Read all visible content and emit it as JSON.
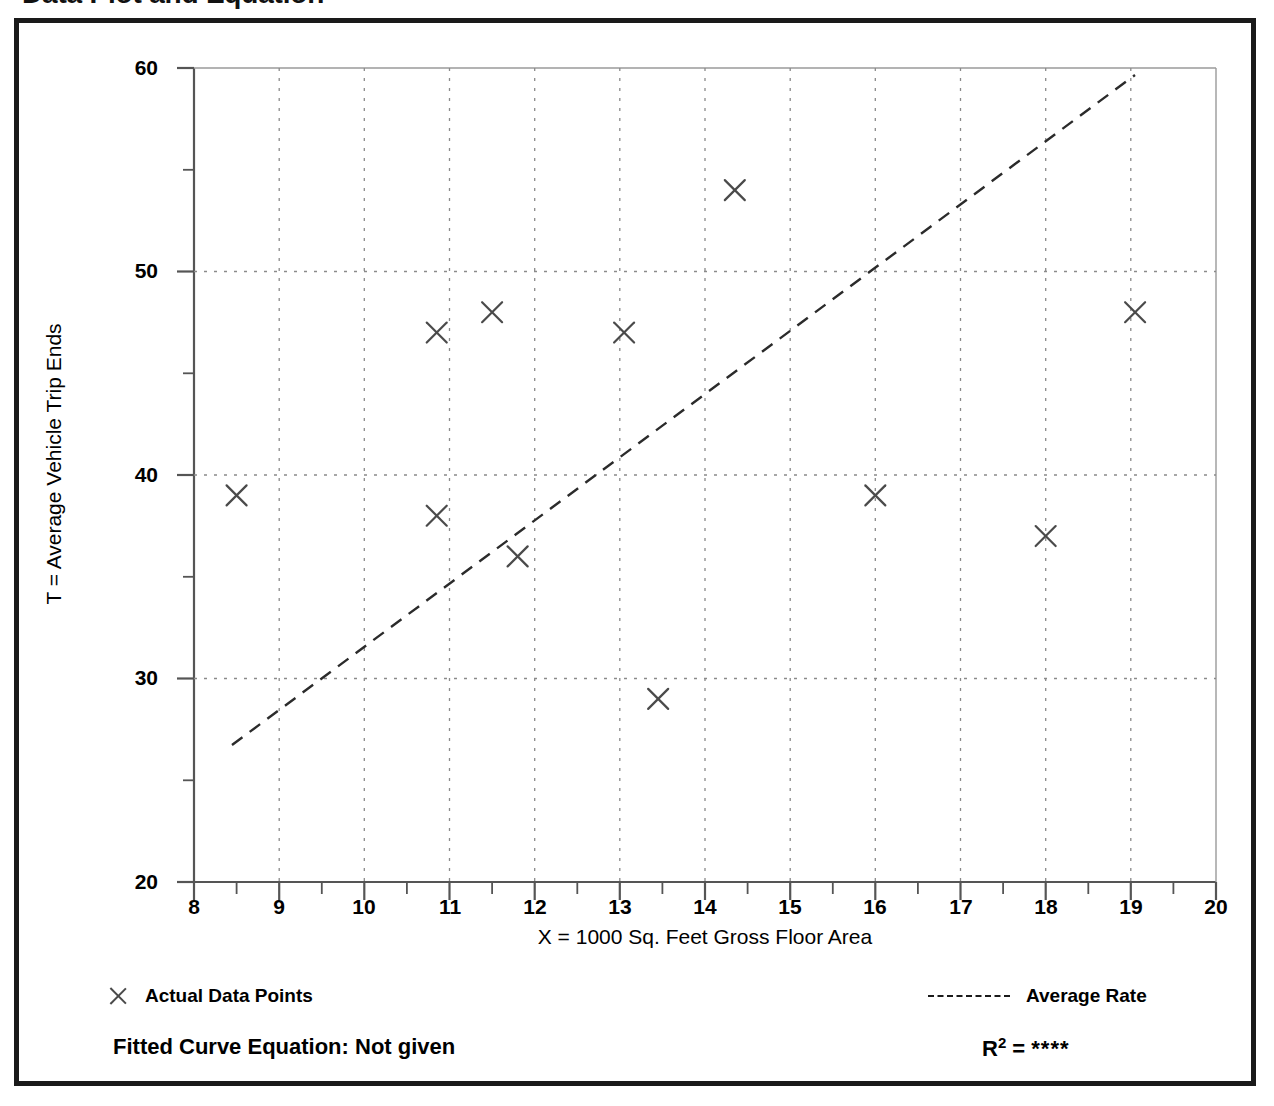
{
  "title": "Data Plot and Equation",
  "legend": {
    "points_label": "Actual Data Points",
    "line_label": "Average Rate",
    "marker_icon": "x-marker-icon",
    "line_icon": "dashed-line-icon"
  },
  "footer": {
    "equation_label": "Fitted Curve Equation:  Not given",
    "r_label": "R",
    "r_exponent": "2",
    "r_equals": " = ",
    "r_value": "****"
  },
  "colors": {
    "frame": "#1a1a1a",
    "axis": "#555555",
    "grid": "#8a8a8a",
    "marker": "#4a4a4a",
    "trendline": "#2b2b2b",
    "text": "#000000"
  },
  "chart_data": {
    "type": "scatter",
    "title": "Data Plot and Equation",
    "xlabel": "X = 1000 Sq. Feet Gross Floor Area",
    "ylabel": "T = Average Vehicle Trip Ends",
    "xlim": [
      8,
      20
    ],
    "ylim": [
      20,
      60
    ],
    "xticks": [
      8,
      9,
      10,
      11,
      12,
      13,
      14,
      15,
      16,
      17,
      18,
      19,
      20
    ],
    "yticks": [
      20,
      30,
      40,
      50,
      60
    ],
    "y_minor_ticks": [
      25,
      35,
      45,
      55
    ],
    "grid": true,
    "grid_style": "dotted",
    "legend_position": "below-plot",
    "series": [
      {
        "name": "Actual Data Points",
        "type": "scatter",
        "marker": "x",
        "points": [
          {
            "x": 8.5,
            "y": 39
          },
          {
            "x": 10.85,
            "y": 47
          },
          {
            "x": 10.85,
            "y": 38
          },
          {
            "x": 11.5,
            "y": 48
          },
          {
            "x": 11.8,
            "y": 36
          },
          {
            "x": 13.05,
            "y": 47
          },
          {
            "x": 13.45,
            "y": 29
          },
          {
            "x": 14.35,
            "y": 54
          },
          {
            "x": 16.0,
            "y": 39
          },
          {
            "x": 18.0,
            "y": 37
          },
          {
            "x": 19.05,
            "y": 48
          }
        ]
      },
      {
        "name": "Average Rate",
        "type": "line",
        "style": "dashed",
        "endpoints": [
          {
            "x": 8.45,
            "y": 26.7
          },
          {
            "x": 19.05,
            "y": 59.5
          }
        ]
      }
    ]
  },
  "axis": {
    "y_tick_labels": [
      "60",
      "50",
      "40",
      "30",
      "20"
    ],
    "x_tick_labels": [
      "8",
      "9",
      "10",
      "11",
      "12",
      "13",
      "14",
      "15",
      "16",
      "17",
      "18",
      "19",
      "20"
    ]
  }
}
